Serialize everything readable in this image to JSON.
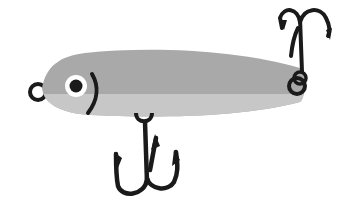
{
  "image": {
    "subject": "fishing lure illustration",
    "colors": {
      "background": "#ffffff",
      "body_top": "#a9a9a9",
      "body_bottom": "#c9c9c9",
      "outline": "#1a1a1a",
      "eye_white": "#ffffff",
      "pupil": "#1a1a1a"
    }
  }
}
